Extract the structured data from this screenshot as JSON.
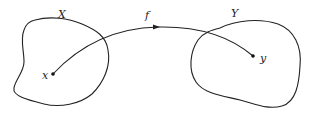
{
  "diagram": {
    "type": "function-mapping",
    "sets": [
      {
        "name": "X",
        "label": "X"
      },
      {
        "name": "Y",
        "label": "Y"
      }
    ],
    "points": [
      {
        "name": "x",
        "label": "x",
        "in_set": "X"
      },
      {
        "name": "y",
        "label": "y",
        "in_set": "Y"
      }
    ],
    "arrow": {
      "label": "f",
      "from": "x",
      "to": "y"
    },
    "colors": {
      "stroke": "#222222",
      "background": "#ffffff"
    }
  }
}
